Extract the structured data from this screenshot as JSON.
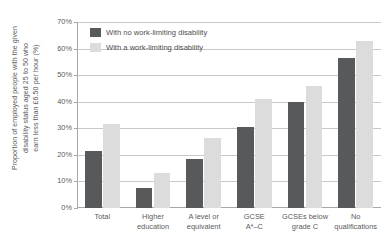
{
  "chart_data": {
    "type": "bar",
    "title": "",
    "subtitle": "",
    "xlabel": "",
    "ylabel": "Proportion of employed people with the given disability status aged 25 to 50 who earn less than £6.50 per hour (%)",
    "ylim": [
      0,
      70
    ],
    "ytick_labels": [
      "0%",
      "10%",
      "20%",
      "30%",
      "40%",
      "50%",
      "60%",
      "70%"
    ],
    "ytick_values": [
      0,
      10,
      20,
      30,
      40,
      50,
      60,
      70
    ],
    "grid": true,
    "legend_position": "top-left-inside",
    "categories": [
      "Total",
      "Higher education",
      "A level or equivalent",
      "GCSE A*–C",
      "GCSEs below grade C",
      "No qualifications"
    ],
    "category_label_lines": [
      [
        "Total"
      ],
      [
        "Higher",
        "education"
      ],
      [
        "A level or",
        "equivalent"
      ],
      [
        "GCSE",
        "A*–C"
      ],
      [
        "GCSEs below",
        "grade C"
      ],
      [
        "No",
        "qualifications"
      ]
    ],
    "series": [
      {
        "name": "With no work-limiting disability",
        "color": "#58595b",
        "values": [
          21.5,
          7.5,
          18.5,
          30.5,
          40.0,
          56.5
        ]
      },
      {
        "name": "With a work-limiting disability",
        "color": "#dcdcdc",
        "values": [
          31.5,
          13.0,
          26.5,
          41.0,
          46.0,
          63.0
        ]
      }
    ]
  },
  "axis": {
    "y_title_lines": [
      "Proportion of employed people with the given",
      "disability status aged 25 to 50 who",
      "earn less than £6.50 per hour (%)"
    ]
  },
  "colors": {
    "series_no_disability": "#58595b",
    "series_with_disability": "#dcdcdc",
    "gridline": "#c9c9c9",
    "axis": "#a8a8a8",
    "text": "#5a5b5d",
    "background": "#ffffff"
  }
}
